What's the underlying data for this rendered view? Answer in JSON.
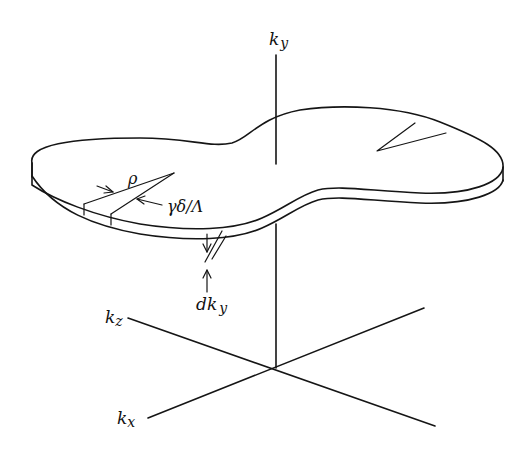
{
  "diagram": {
    "type": "3D momentum-space sketch",
    "colors": {
      "ink": "#151515",
      "background": "#ffffff"
    },
    "labels": {
      "ky_axis": "k",
      "ky_axis_sub": "y",
      "kz_axis": "k",
      "kz_axis_sub": "z",
      "kx_axis": "k",
      "kx_axis_sub": "x",
      "rho": "ρ",
      "angle": "γδ/Λ",
      "slab_thickness": "dk",
      "slab_thickness_sub": "y"
    },
    "axes": {
      "origin": [
        276,
        368
      ],
      "ky": {
        "from": [
          276,
          368
        ],
        "to": [
          276,
          55
        ],
        "hidden_segment": [
          164,
          225
        ]
      },
      "kz": {
        "from": [
          128,
          318
        ],
        "to": [
          435,
          426
        ]
      },
      "kx": {
        "from": [
          148,
          418
        ],
        "to": [
          424,
          308
        ]
      }
    }
  }
}
